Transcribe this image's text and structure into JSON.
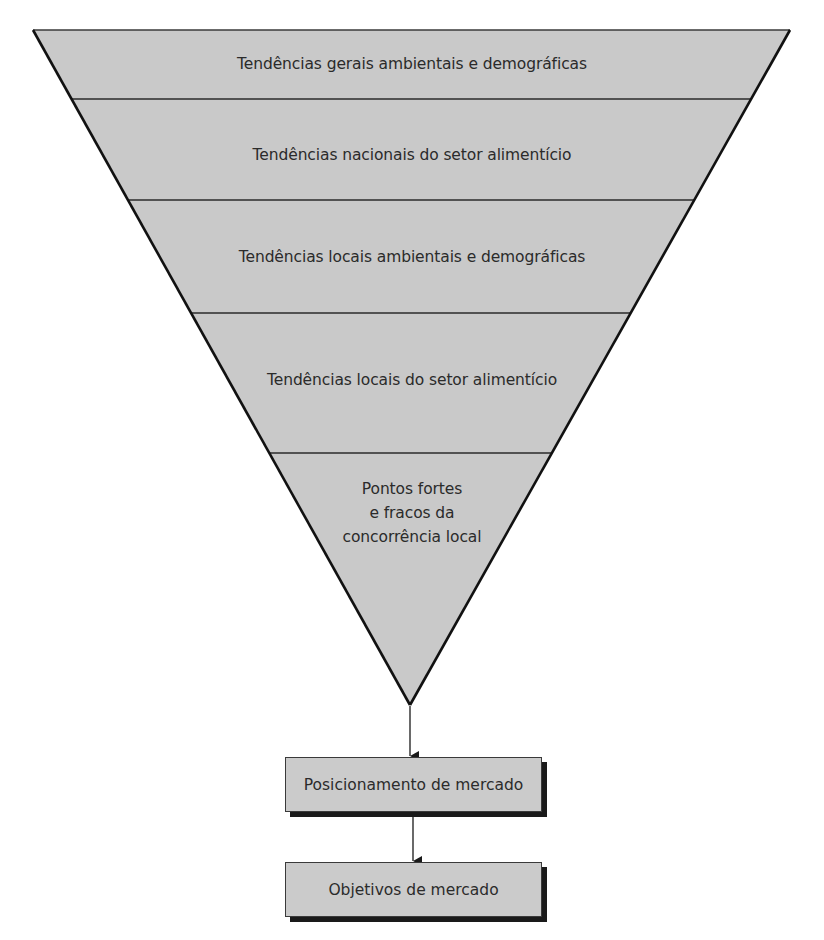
{
  "diagram": {
    "type": "inverted-funnel",
    "fill_color": "#c9c9c9",
    "stroke_color": "#1a1a1a",
    "funnel_levels": [
      {
        "label": "Tendências gerais ambientais e demográficas"
      },
      {
        "label": "Tendências nacionais do setor alimentício"
      },
      {
        "label": "Tendências locais ambientais e demográficas"
      },
      {
        "label": "Tendências locais do setor alimentício"
      },
      {
        "label": "Pontos fortes\ne fracos da\nconcorrência local"
      }
    ],
    "outputs": [
      {
        "label": "Posicionamento de mercado"
      },
      {
        "label": "Objetivos de mercado"
      }
    ]
  }
}
